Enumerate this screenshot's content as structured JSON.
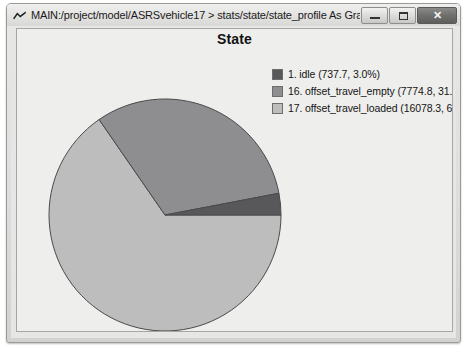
{
  "window": {
    "title": "MAIN:/project/model/ASRSvehicle17 > stats/state/state_profile As Graph",
    "app_icon": "chevron-mountain-icon",
    "buttons": {
      "minimize_label": "–",
      "maximize_label": "□",
      "close_label": "✕"
    }
  },
  "chart_data": {
    "type": "pie",
    "title": "State",
    "xlabel": "",
    "ylabel": "",
    "legend_position": "right",
    "grid": false,
    "categories": [
      "1. idle",
      "16. offset_travel_empty",
      "17. offset_travel_loaded"
    ],
    "values": [
      737.7,
      7774.8,
      16078.3
    ],
    "percents": [
      3.0,
      31.6,
      65.4
    ],
    "colors": [
      "#58585a",
      "#8e8e90",
      "#bdbdbd"
    ],
    "legend_entries": [
      "1. idle (737.7, 3.0%)",
      "16. offset_travel_empty (7774.8, 31.6%",
      "17. offset_travel_loaded (16078.3, 65.4°"
    ],
    "start_angle_deg": 0,
    "direction": "counterclockwise"
  }
}
